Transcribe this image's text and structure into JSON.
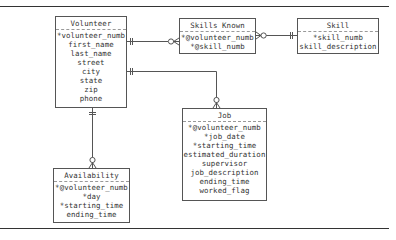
{
  "diagram": {
    "type": "entity-relationship",
    "entities": [
      {
        "id": "volunteer",
        "title": "Volunteer",
        "attributes": [
          "*volunteer_numb",
          "first_name",
          "last_name",
          "street",
          "city",
          "state",
          "zip",
          "phone"
        ]
      },
      {
        "id": "skills_known",
        "title": "Skills Known",
        "attributes": [
          "*@volunteer_numb",
          "*@skill_numb"
        ]
      },
      {
        "id": "skill",
        "title": "Skill",
        "attributes": [
          "*skill_numb",
          "skill_description"
        ]
      },
      {
        "id": "job",
        "title": "Job",
        "attributes": [
          "*@volunteer_numb",
          "*job_date",
          "*starting_time",
          "estimated_duration",
          "supervisor",
          "job_description",
          "ending_time",
          "worked_flag"
        ]
      },
      {
        "id": "availability",
        "title": "Availability",
        "attributes": [
          "*@volunteer_numb",
          "*day",
          "*starting_time",
          "ending_time"
        ]
      }
    ],
    "relationships": [
      {
        "from": "Volunteer",
        "to": "Skills Known",
        "from_cardinality": "one-and-only-one",
        "to_cardinality": "zero-or-many"
      },
      {
        "from": "Skill",
        "to": "Skills Known",
        "from_cardinality": "one-and-only-one",
        "to_cardinality": "zero-or-many"
      },
      {
        "from": "Volunteer",
        "to": "Job",
        "from_cardinality": "one-and-only-one",
        "to_cardinality": "zero-or-many"
      },
      {
        "from": "Volunteer",
        "to": "Availability",
        "from_cardinality": "one-and-only-one",
        "to_cardinality": "zero-or-many"
      }
    ],
    "colors": {
      "line": "#555555",
      "text": "#333333",
      "background": "#ffffff"
    }
  }
}
